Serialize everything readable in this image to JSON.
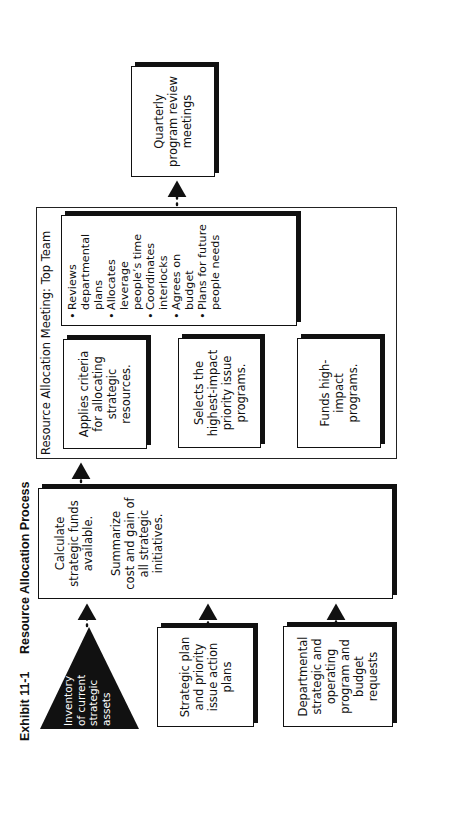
{
  "exhibit": {
    "number": "Exhibit 11-1",
    "title": "Resource Allocation Process"
  },
  "inputs": {
    "inventory": {
      "lines": [
        "Inventory",
        "of current",
        "strategic",
        "assets"
      ],
      "shape": "triangle"
    },
    "strategic_plan": {
      "lines": [
        "Strategic plan",
        "and priority",
        "issue action",
        "plans"
      ]
    },
    "departmental": {
      "lines": [
        "Departmental",
        "strategic and",
        "operating",
        "program and",
        "budget",
        "requests"
      ]
    }
  },
  "calculate_box": {
    "para1": [
      "Calculate",
      "strategic funds",
      "available."
    ],
    "para2": [
      "Summarize",
      "cost and gain of",
      "all strategic",
      "initiatives."
    ]
  },
  "meeting": {
    "label": "Resource Allocation Meeting: Top Team",
    "steps": [
      {
        "lines": [
          "Applies criteria",
          "for allocating",
          "strategic",
          "resources."
        ]
      },
      {
        "lines": [
          "Selects the",
          "highest-impact",
          "priority issue",
          "programs."
        ]
      },
      {
        "lines": [
          "Funds high-",
          "impact",
          "programs."
        ]
      }
    ],
    "bullets": [
      [
        "Reviews",
        "departmental",
        "plans"
      ],
      [
        "Allocates",
        "leverage",
        "people’s time"
      ],
      [
        "Coordinates",
        "interlocks"
      ],
      [
        "Agrees on",
        "budget"
      ],
      [
        "Plans for future",
        "people needs"
      ]
    ]
  },
  "review_box": {
    "lines": [
      "Quarterly",
      "program review",
      "meetings"
    ]
  },
  "colors": {
    "ink": "#111111",
    "background": "#ffffff"
  }
}
